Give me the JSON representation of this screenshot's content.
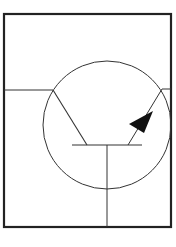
{
  "diagram": {
    "title": "",
    "type": "transistor-symbol",
    "colors": {
      "background": "#ffffff",
      "stroke": "#1a1a1a",
      "frame": "#222222"
    },
    "elements": [
      "outer-frame",
      "transistor-circle",
      "base-lead",
      "collector-lead",
      "emitter-lead",
      "emitter-arrow",
      "base-bar",
      "base-terminal"
    ]
  }
}
